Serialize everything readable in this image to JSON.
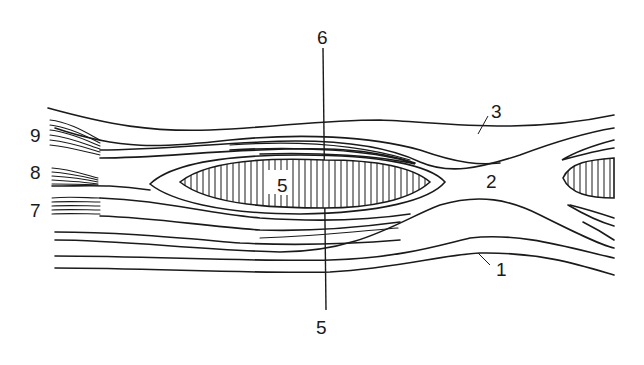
{
  "diagram": {
    "colors": {
      "line": "#1a1a1a",
      "background": "#ffffff"
    },
    "labels": [
      {
        "id": "1",
        "text": "1",
        "x": 496,
        "y": 260
      },
      {
        "id": "2",
        "text": "2",
        "x": 486,
        "y": 172
      },
      {
        "id": "3",
        "text": "3",
        "x": 491,
        "y": 102
      },
      {
        "id": "4",
        "text": "4",
        "x": 316,
        "y": 318
      },
      {
        "id": "5",
        "text": "5",
        "x": 276,
        "y": 176
      },
      {
        "id": "6",
        "text": "6",
        "x": 317,
        "y": 28
      },
      {
        "id": "7",
        "text": "7",
        "x": 30,
        "y": 201
      },
      {
        "id": "8",
        "text": "8",
        "x": 30,
        "y": 163
      },
      {
        "id": "9",
        "text": "9",
        "x": 30,
        "y": 126
      }
    ]
  }
}
